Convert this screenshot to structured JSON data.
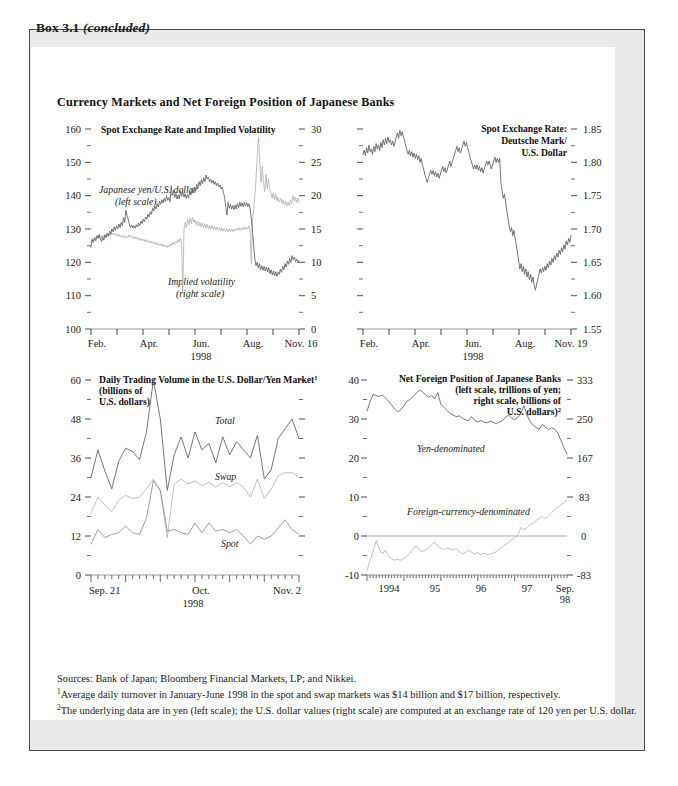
{
  "box": {
    "label_main": "Box 3.1",
    "label_note": "(concluded)",
    "panel_title": "Currency Markets and Net Foreign Position of Japanese Banks"
  },
  "footnotes": {
    "sources": "Sources:  Bank of Japan; Bloomberg Financial Markets, LP; and Nikkei.",
    "note1_marker": "1",
    "note1": "Average daily turnover in January-June 1998 in the spot and swap markets was $14 billion and $17 billion, respectively.",
    "note2_marker": "2",
    "note2": "The underlying data are in yen (left scale); the U.S. dollar values (right scale) are computed at an exchange rate of 120 yen per U.S. dollar."
  },
  "colors": {
    "dark_series": "#5d5d5d",
    "light_series": "#b2b2b2",
    "mid_series": "#8e8e8e",
    "axis": "#9a9a9a",
    "box_fill": "#e9e9e9",
    "panel_fill": "#ffffff",
    "text": "#1a1a1a"
  },
  "chart_data": [
    {
      "id": "spot-rate-implied-volatility",
      "type": "line",
      "title": "Spot Exchange Rate and Implied Volatility",
      "xlabel": "1998",
      "x_ticks": [
        "Feb.",
        "Apr.",
        "Jun.",
        "Aug.",
        "Nov. 16"
      ],
      "ylabel_left": "",
      "ylabel_right": "",
      "ylim_left": [
        100,
        160
      ],
      "ylim_right": [
        0,
        30
      ],
      "y_ticks_left": [
        "100",
        "110",
        "120",
        "130",
        "140",
        "150",
        "160"
      ],
      "y_ticks_right": [
        "0",
        "5",
        "10",
        "15",
        "20",
        "25",
        "30"
      ],
      "annotations": [
        "Japanese yen/U.S. dollar",
        "(left scale)",
        "Implied volatility",
        "(right scale)"
      ],
      "series": [
        {
          "name": "Japanese yen/U.S. dollar (left scale)",
          "scale": "left",
          "color": "#5d5d5d",
          "values": [
            124.5,
            126.8,
            126.0,
            127.2,
            126.5,
            128.0,
            127.3,
            128.4,
            127.0,
            126.2,
            127.5,
            126.6,
            128.2,
            127.4,
            128.8,
            127.9,
            129.4,
            128.5,
            130.0,
            129.2,
            130.6,
            129.6,
            131.0,
            130.1,
            131.5,
            130.4,
            132.0,
            131.0,
            133.4,
            132.0,
            135.6,
            134.0,
            133.0,
            131.5,
            130.4,
            131.2,
            130.3,
            131.0,
            130.2,
            131.3,
            130.6,
            131.8,
            131.0,
            132.4,
            131.6,
            133.0,
            132.2,
            133.6,
            133.0,
            134.4,
            133.6,
            135.2,
            134.4,
            136.2,
            135.4,
            136.8,
            136.0,
            137.6,
            136.6,
            138.4,
            137.4,
            138.8,
            137.8,
            139.2,
            138.2,
            140.0,
            138.6,
            139.4,
            138.2,
            143.0,
            140.0,
            141.6,
            139.4,
            140.6,
            139.0,
            140.2,
            139.0,
            141.4,
            139.8,
            141.0,
            139.6,
            140.6,
            139.2,
            140.4,
            139.4,
            141.2,
            140.2,
            142.2,
            141.0,
            142.6,
            141.4,
            143.4,
            142.2,
            144.2,
            143.0,
            144.8,
            143.6,
            145.4,
            144.2,
            146.2,
            145.0,
            145.6,
            144.2,
            145.0,
            143.8,
            144.6,
            143.4,
            144.2,
            143.0,
            143.8,
            142.6,
            143.2,
            142.0,
            142.6,
            141.0,
            139.4,
            136.8,
            134.2,
            138.0,
            136.2,
            137.4,
            136.0,
            137.0,
            135.8,
            137.2,
            136.0,
            137.6,
            136.4,
            138.0,
            136.8,
            137.8,
            136.6,
            138.0,
            136.9,
            137.9,
            136.8,
            137.6,
            136.0,
            133.0,
            129.0,
            125.0,
            121.0,
            119.0,
            120.0,
            118.4,
            119.6,
            117.8,
            119.0,
            117.6,
            118.8,
            117.4,
            118.6,
            117.2,
            118.4,
            116.6,
            117.8,
            116.2,
            117.4,
            116.0,
            117.2,
            115.8,
            117.0,
            116.4,
            118.0,
            117.0,
            118.8,
            117.8,
            119.6,
            118.6,
            120.4,
            119.4,
            121.2,
            120.0,
            122.0,
            120.8,
            121.6,
            120.2,
            121.0,
            119.8,
            120.6
          ]
        },
        {
          "name": "Implied volatility (right scale)",
          "scale": "right",
          "color": "#b2b2b2",
          "values": [
            13.0,
            13.6,
            13.2,
            13.8,
            13.4,
            13.9,
            13.5,
            14.0,
            13.6,
            14.1,
            13.7,
            14.2,
            13.8,
            14.2,
            13.9,
            14.3,
            14.0,
            14.4,
            14.1,
            14.4,
            14.0,
            14.3,
            13.9,
            14.2,
            13.8,
            14.1,
            13.7,
            14.0,
            13.6,
            14.0,
            13.7,
            14.1,
            13.8,
            14.0,
            13.6,
            13.9,
            13.5,
            13.8,
            13.4,
            13.7,
            13.3,
            13.6,
            13.2,
            13.5,
            13.1,
            13.4,
            13.0,
            13.3,
            12.9,
            13.2,
            12.8,
            13.1,
            12.7,
            13.0,
            12.6,
            12.9,
            12.5,
            12.8,
            12.4,
            12.7,
            12.3,
            12.6,
            12.2,
            12.6,
            12.3,
            12.8,
            12.5,
            13.0,
            12.7,
            13.2,
            12.9,
            13.4,
            13.0,
            13.6,
            13.2,
            5.2,
            14.8,
            16.0,
            15.2,
            16.4,
            15.6,
            16.6,
            15.8,
            16.8,
            16.0,
            16.4,
            15.6,
            16.2,
            15.4,
            16.0,
            15.3,
            15.9,
            15.2,
            15.8,
            15.1,
            15.7,
            15.0,
            15.6,
            15.0,
            15.5,
            14.9,
            15.4,
            14.8,
            15.3,
            14.8,
            15.2,
            14.7,
            15.2,
            14.7,
            15.1,
            14.6,
            15.1,
            14.6,
            15.0,
            14.6,
            15.0,
            14.6,
            15.0,
            14.7,
            15.1,
            14.8,
            15.2,
            14.8,
            15.2,
            14.9,
            15.3,
            14.9,
            15.3,
            15.0,
            15.4,
            15.0,
            9.8,
            16.2,
            18.0,
            20.0,
            23.0,
            26.4,
            28.8,
            24.6,
            22.0,
            24.4,
            22.0,
            20.6,
            23.2,
            21.0,
            22.6,
            21.0,
            20.4,
            19.6,
            20.4,
            19.4,
            20.2,
            19.2,
            19.8,
            19.0,
            19.6,
            18.8,
            19.4,
            18.6,
            19.2,
            18.4,
            19.0,
            18.5,
            19.4,
            18.8,
            20.0,
            19.2,
            19.8,
            19.0,
            19.6,
            19.0
          ]
        }
      ]
    },
    {
      "id": "spot-rate-dem-usd",
      "type": "line",
      "title_lines": [
        "Spot Exchange Rate:",
        "Deutsche Mark/",
        "U.S. Dollar"
      ],
      "xlabel": "1998",
      "x_ticks": [
        "Feb.",
        "Apr.",
        "Jun.",
        "Aug.",
        "Nov. 19"
      ],
      "ylim": [
        1.55,
        1.85
      ],
      "y_ticks_right": [
        "1.55",
        "1.60",
        "1.65",
        "1.70",
        "1.75",
        "1.80",
        "1.85"
      ],
      "series": [
        {
          "name": "Deutsche Mark/U.S. Dollar",
          "color": "#5d5d5d",
          "values": [
            1.812,
            1.818,
            1.81,
            1.822,
            1.814,
            1.826,
            1.816,
            1.82,
            1.812,
            1.824,
            1.816,
            1.828,
            1.82,
            1.826,
            1.818,
            1.83,
            1.822,
            1.834,
            1.826,
            1.836,
            1.828,
            1.838,
            1.83,
            1.834,
            1.826,
            1.832,
            1.824,
            1.83,
            1.838,
            1.844,
            1.836,
            1.848,
            1.84,
            1.846,
            1.838,
            1.832,
            1.824,
            1.818,
            1.812,
            1.818,
            1.81,
            1.816,
            1.808,
            1.814,
            1.806,
            1.812,
            1.804,
            1.81,
            1.8,
            1.806,
            1.796,
            1.79,
            1.782,
            1.776,
            1.77,
            1.776,
            1.782,
            1.788,
            1.782,
            1.788,
            1.78,
            1.786,
            1.778,
            1.784,
            1.776,
            1.782,
            1.788,
            1.794,
            1.786,
            1.792,
            1.784,
            1.79,
            1.796,
            1.802,
            1.794,
            1.8,
            1.806,
            1.812,
            1.818,
            1.824,
            1.816,
            1.822,
            1.814,
            1.82,
            1.826,
            1.832,
            1.824,
            1.83,
            1.822,
            1.816,
            1.808,
            1.802,
            1.796,
            1.79,
            1.796,
            1.79,
            1.796,
            1.788,
            1.794,
            1.786,
            1.792,
            1.784,
            1.79,
            1.796,
            1.802,
            1.796,
            1.802,
            1.796,
            1.79,
            1.796,
            1.802,
            1.808,
            1.8,
            1.806,
            1.8,
            1.806,
            1.77,
            1.758,
            1.746,
            1.752,
            1.74,
            1.728,
            1.716,
            1.704,
            1.696,
            1.702,
            1.69,
            1.698,
            1.686,
            1.676,
            1.664,
            1.652,
            1.64,
            1.648,
            1.636,
            1.644,
            1.632,
            1.64,
            1.628,
            1.636,
            1.624,
            1.632,
            1.62,
            1.628,
            1.616,
            1.608,
            1.616,
            1.624,
            1.632,
            1.64,
            1.634,
            1.642,
            1.636,
            1.644,
            1.638,
            1.648,
            1.642,
            1.652,
            1.646,
            1.656,
            1.65,
            1.66,
            1.654,
            1.664,
            1.658,
            1.668,
            1.662,
            1.672,
            1.666,
            1.676,
            1.67,
            1.682,
            1.676,
            1.686,
            1.68,
            1.69
          ]
        }
      ]
    },
    {
      "id": "daily-trading-volume",
      "type": "line",
      "title": "Daily Trading Volume in the U.S. Dollar/Yen Market",
      "title_footnote": "1",
      "title_sub": [
        "(billions of",
        "U.S. dollars)"
      ],
      "xlabel": "1998",
      "x_ticks": [
        "Sep. 21",
        "Oct.",
        "Nov. 2"
      ],
      "ylim": [
        0,
        60
      ],
      "y_ticks": [
        "0",
        "12",
        "24",
        "36",
        "48",
        "60"
      ],
      "annotations": [
        "Total",
        "Swap",
        "Spot"
      ],
      "series": [
        {
          "name": "Total",
          "color": "#5d5d5d",
          "values": [
            30.0,
            38.5,
            32.0,
            26.5,
            35.0,
            39.0,
            38.0,
            35.5,
            44.0,
            60.0,
            48.0,
            26.0,
            37.0,
            42.5,
            36.0,
            44.0,
            38.5,
            40.5,
            34.5,
            42.5,
            37.0,
            41.0,
            38.5,
            36.0,
            43.0,
            29.5,
            32.5,
            42.0,
            45.0,
            48.0,
            42.0
          ]
        },
        {
          "name": "Swap",
          "color": "#b2b2b2",
          "values": [
            19.0,
            24.0,
            21.5,
            19.5,
            23.0,
            24.5,
            23.5,
            24.0,
            26.5,
            29.5,
            26.0,
            11.5,
            28.0,
            29.5,
            28.0,
            29.0,
            27.5,
            28.5,
            27.0,
            28.5,
            27.0,
            28.5,
            27.0,
            24.0,
            29.5,
            23.5,
            26.5,
            30.5,
            31.5,
            31.5,
            30.0
          ]
        },
        {
          "name": "Spot",
          "color": "#8e8e8e",
          "values": [
            9.5,
            14.0,
            11.5,
            12.5,
            13.0,
            15.0,
            13.0,
            12.5,
            17.5,
            29.0,
            26.0,
            13.5,
            14.0,
            13.0,
            12.5,
            16.0,
            13.0,
            16.0,
            13.5,
            14.0,
            13.0,
            14.0,
            12.0,
            9.5,
            12.0,
            11.0,
            12.0,
            14.5,
            17.0,
            14.0,
            12.5
          ]
        }
      ]
    },
    {
      "id": "net-foreign-position",
      "type": "line",
      "title_lines": [
        "Net Foreign Position of Japanese Banks",
        "(left scale, trillions of yen;",
        "right scale, billions of",
        "U.S. dollars)"
      ],
      "title_footnote": "2",
      "x_ticks": [
        "1994",
        "95",
        "96",
        "97",
        "Sep.|98"
      ],
      "ylim_left": [
        -10,
        40
      ],
      "ylim_right": [
        -83,
        333
      ],
      "y_ticks_left": [
        "-10",
        "0",
        "10",
        "20",
        "30",
        "40"
      ],
      "y_ticks_right": [
        "-83",
        "0",
        "83",
        "167",
        "250",
        "333"
      ],
      "annotations": [
        "Yen-denominated",
        "Foreign-currency-denominated"
      ],
      "series": [
        {
          "name": "Yen-denominated",
          "color": "#5d5d5d",
          "values": [
            32.0,
            34.5,
            36.3,
            36.0,
            35.8,
            36.2,
            35.4,
            34.6,
            33.6,
            32.6,
            31.8,
            32.4,
            33.4,
            34.6,
            35.0,
            35.8,
            36.6,
            37.4,
            37.0,
            36.2,
            35.6,
            36.0,
            35.2,
            36.8,
            33.8,
            33.0,
            32.2,
            31.4,
            31.0,
            30.6,
            30.8,
            30.2,
            29.8,
            29.6,
            30.6,
            29.6,
            29.2,
            29.6,
            29.2,
            29.0,
            29.4,
            29.2,
            28.8,
            29.2,
            29.6,
            30.4,
            31.0,
            30.2,
            29.8,
            30.4,
            31.4,
            33.4,
            31.0,
            29.4,
            28.4,
            27.8,
            27.4,
            28.6,
            28.0,
            27.2,
            27.8,
            27.4,
            26.4,
            24.6,
            22.6,
            21.0
          ]
        },
        {
          "name": "Foreign-currency-denominated",
          "color": "#b2b2b2",
          "values": [
            -8.8,
            -6.2,
            -4.0,
            -1.2,
            -3.4,
            -4.6,
            -3.6,
            -5.0,
            -5.8,
            -6.2,
            -6.0,
            -6.2,
            -5.8,
            -5.2,
            -4.4,
            -3.2,
            -2.6,
            -3.6,
            -4.0,
            -3.6,
            -3.0,
            -2.2,
            -1.6,
            -2.6,
            -3.2,
            -3.4,
            -3.0,
            -3.4,
            -3.6,
            -3.2,
            -4.0,
            -4.6,
            -4.2,
            -3.6,
            -4.2,
            -4.6,
            -4.2,
            -4.8,
            -4.4,
            -4.8,
            -4.6,
            -4.4,
            -4.0,
            -3.4,
            -2.8,
            -2.2,
            -1.6,
            -1.0,
            -0.4,
            0.2,
            2.2,
            1.6,
            2.2,
            3.0,
            3.2,
            4.0,
            4.6,
            5.0,
            4.4,
            5.2,
            6.0,
            6.8,
            7.4,
            8.0,
            8.6,
            9.2
          ]
        }
      ]
    }
  ]
}
